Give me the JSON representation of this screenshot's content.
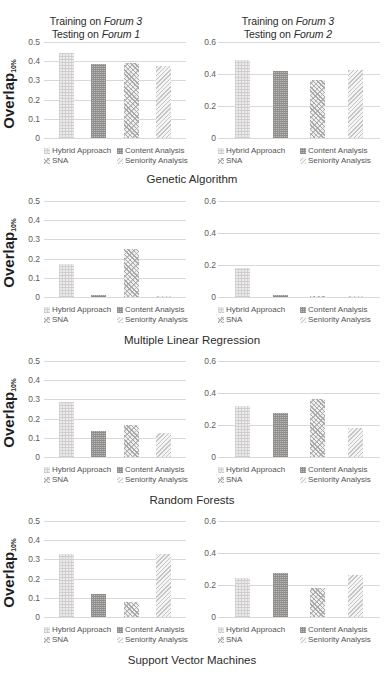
{
  "axis": {
    "ylabel_main": "Overlap",
    "ylabel_sub": "10%",
    "left_ticks": [
      "0.5",
      "0.4",
      "0.3",
      "0.2",
      "0.1",
      "0"
    ],
    "right_ticks": [
      "0.6",
      "0.4",
      "0.2",
      "0"
    ]
  },
  "legend": [
    {
      "label": "Hybrid Approach",
      "pattern": "p-hybrid"
    },
    {
      "label": "Content Analysis",
      "pattern": "p-content"
    },
    {
      "label": "SNA",
      "pattern": "p-sna"
    },
    {
      "label": "Seniority Analysis",
      "pattern": "p-seniority"
    }
  ],
  "titles": {
    "left": {
      "line1": "Training on ",
      "line1_em": "Forum 3",
      "line2": "Testing on ",
      "line2_em": "Forum 1"
    },
    "right": {
      "line1": "Training on ",
      "line1_em": "Forum 3",
      "line2": "Testing on ",
      "line2_em": "Forum 2"
    }
  },
  "captions": {
    "row1": "Genetic Algorithm",
    "row2": "Multiple Linear Regression",
    "row3": "Random Forests",
    "row4": "Support Vector Machines"
  },
  "chart_data": [
    {
      "type": "bar",
      "title": "Training on Forum 3 / Testing on Forum 1",
      "panel": "left",
      "row_caption": "Genetic Algorithm",
      "xlabel": "",
      "ylabel": "Overlap10%",
      "ylim": [
        0,
        0.5
      ],
      "yticks": [
        0,
        0.1,
        0.2,
        0.3,
        0.4,
        0.5
      ],
      "grid": true,
      "legend_position": "below",
      "categories": [
        "Hybrid Approach",
        "Content Analysis",
        "SNA",
        "Seniority Analysis"
      ],
      "values": [
        0.445,
        0.385,
        0.39,
        0.375
      ]
    },
    {
      "type": "bar",
      "title": "Training on Forum 3 / Testing on Forum 2",
      "panel": "right",
      "row_caption": "Genetic Algorithm",
      "xlabel": "",
      "ylabel": "Overlap10%",
      "ylim": [
        0,
        0.6
      ],
      "yticks": [
        0,
        0.2,
        0.4,
        0.6
      ],
      "grid": true,
      "legend_position": "below",
      "categories": [
        "Hybrid Approach",
        "Content Analysis",
        "SNA",
        "Seniority Analysis"
      ],
      "values": [
        0.49,
        0.42,
        0.365,
        0.425
      ]
    },
    {
      "type": "bar",
      "title": "Training on Forum 3 / Testing on Forum 1",
      "panel": "left",
      "row_caption": "Multiple Linear Regression",
      "xlabel": "",
      "ylabel": "Overlap10%",
      "ylim": [
        0,
        0.5
      ],
      "yticks": [
        0,
        0.1,
        0.2,
        0.3,
        0.4,
        0.5
      ],
      "grid": true,
      "legend_position": "below",
      "categories": [
        "Hybrid Approach",
        "Content Analysis",
        "SNA",
        "Seniority Analysis"
      ],
      "values": [
        0.17,
        0.008,
        0.25,
        0.002
      ]
    },
    {
      "type": "bar",
      "title": "Training on Forum 3 / Testing on Forum 2",
      "panel": "right",
      "row_caption": "Multiple Linear Regression",
      "xlabel": "",
      "ylabel": "Overlap10%",
      "ylim": [
        0,
        0.6
      ],
      "yticks": [
        0,
        0.2,
        0.4,
        0.6
      ],
      "grid": true,
      "legend_position": "below",
      "categories": [
        "Hybrid Approach",
        "Content Analysis",
        "SNA",
        "Seniority Analysis"
      ],
      "values": [
        0.18,
        0.01,
        0.004,
        0.006
      ]
    },
    {
      "type": "bar",
      "title": "Training on Forum 3 / Testing on Forum 1",
      "panel": "left",
      "row_caption": "Random Forests",
      "xlabel": "",
      "ylabel": "Overlap10%",
      "ylim": [
        0,
        0.5
      ],
      "yticks": [
        0,
        0.1,
        0.2,
        0.3,
        0.4,
        0.5
      ],
      "grid": true,
      "legend_position": "below",
      "categories": [
        "Hybrid Approach",
        "Content Analysis",
        "SNA",
        "Seniority Analysis"
      ],
      "values": [
        0.285,
        0.135,
        0.165,
        0.125
      ]
    },
    {
      "type": "bar",
      "title": "Training on Forum 3 / Testing on Forum 2",
      "panel": "right",
      "row_caption": "Random Forests",
      "xlabel": "",
      "ylabel": "Overlap10%",
      "ylim": [
        0,
        0.6
      ],
      "yticks": [
        0,
        0.2,
        0.4,
        0.6
      ],
      "grid": true,
      "legend_position": "below",
      "categories": [
        "Hybrid Approach",
        "Content Analysis",
        "SNA",
        "Seniority Analysis"
      ],
      "values": [
        0.32,
        0.275,
        0.365,
        0.18
      ]
    },
    {
      "type": "bar",
      "title": "Training on Forum 3 / Testing on Forum 1",
      "panel": "left",
      "row_caption": "Support Vector Machines",
      "xlabel": "",
      "ylabel": "Overlap10%",
      "ylim": [
        0,
        0.5
      ],
      "yticks": [
        0,
        0.1,
        0.2,
        0.3,
        0.4,
        0.5
      ],
      "grid": true,
      "legend_position": "below",
      "categories": [
        "Hybrid Approach",
        "Content Analysis",
        "SNA",
        "Seniority Analysis"
      ],
      "values": [
        0.33,
        0.12,
        0.08,
        0.33
      ]
    },
    {
      "type": "bar",
      "title": "Training on Forum 3 / Testing on Forum 2",
      "panel": "right",
      "row_caption": "Support Vector Machines",
      "xlabel": "",
      "ylabel": "Overlap10%",
      "ylim": [
        0,
        0.6
      ],
      "yticks": [
        0,
        0.2,
        0.4,
        0.6
      ],
      "grid": true,
      "legend_position": "below",
      "categories": [
        "Hybrid Approach",
        "Content Analysis",
        "SNA",
        "Seniority Analysis"
      ],
      "values": [
        0.245,
        0.275,
        0.18,
        0.26
      ]
    }
  ]
}
